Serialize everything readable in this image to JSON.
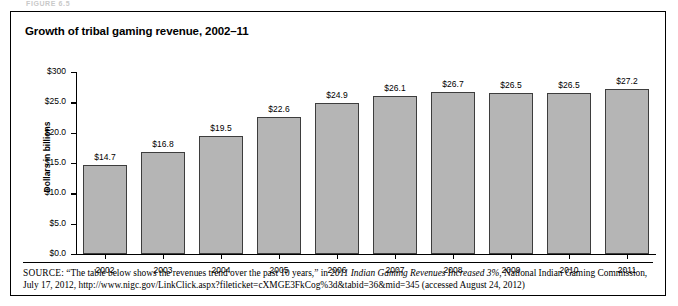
{
  "figure": {
    "caption_above": "FIGURE 6.5",
    "title": "Growth of tribal gaming revenue, 2002–11"
  },
  "axes": {
    "y_axis_title": "Dollars in billions",
    "y_tick_labels": [
      "$300",
      "$25.0",
      "$20.0",
      "$15.0",
      "$10.0",
      "$5.0",
      "$0.0"
    ]
  },
  "source": {
    "label": "SOURCE:",
    "text_part1": " “The table below shows the revenues trend over the past 10 years,” in ",
    "italic_title": "2011 Indian Gaming Revenues Increased 3%",
    "text_part2": ", National Indian Gaming Commission, July 17, 2012, http://www.nigc.gov/LinkClick.aspx?fileticket=cXMGE3FkCog%3d&tabid=36&mid=345 (accessed August 24, 2012)"
  },
  "colors": {
    "bar_fill": "#b5b5b5",
    "bar_stroke": "#3d3d3d",
    "axis": "#000000",
    "frame": "#000000"
  },
  "chart_data": {
    "type": "bar",
    "title": "Growth of tribal gaming revenue, 2002–11",
    "xlabel": "",
    "ylabel": "Dollars in billions",
    "ylim": [
      0,
      30
    ],
    "ytick_values": [
      30,
      25,
      20,
      15,
      10,
      5,
      0
    ],
    "grid": false,
    "legend": null,
    "categories": [
      "2002",
      "2003",
      "2004",
      "2005",
      "2006",
      "2007",
      "2008",
      "2009",
      "2010",
      "2011"
    ],
    "values": [
      14.7,
      16.8,
      19.5,
      22.6,
      24.9,
      26.1,
      26.7,
      26.5,
      26.5,
      27.2
    ],
    "value_labels": [
      "$14.7",
      "$16.8",
      "$19.5",
      "$22.6",
      "$24.9",
      "$26.1",
      "$26.7",
      "$26.5",
      "$26.5",
      "$27.2"
    ],
    "units": "billions of US dollars"
  }
}
